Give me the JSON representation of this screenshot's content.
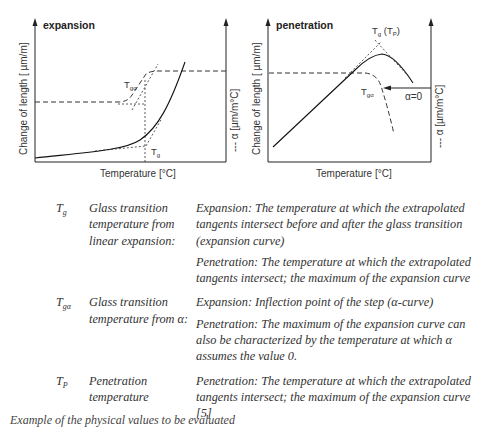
{
  "diagrams": [
    {
      "title": "expansion",
      "y_left_label": "Change of length [ µm/m]",
      "y_right_label": "--- α [µm/m°C]",
      "x_label": "Temperature [°C]",
      "annotations": {
        "tga": "T",
        "tga_sub": "gα",
        "tg": "T",
        "tg_sub": "g"
      }
    },
    {
      "title": "penetration",
      "y_left_label": "Change of length [ µm/m]",
      "y_right_label": "--- α [µm/m°C]",
      "x_label": "Temperature [°C]",
      "annotations": {
        "tg": "T",
        "tg_sub": "g",
        "tp_open": " (T",
        "tp_sub": "P",
        "tp_close": ")",
        "tga": "T",
        "tga_sub": "gα",
        "alpha0": "α=0"
      }
    }
  ],
  "table": [
    {
      "symbol": "T",
      "symbol_sub": "g",
      "name": "Glass transition temperature from linear expansion:",
      "descriptions": [
        "Expansion: The temperature at which the extrapolated tangents intersect before and after the glass transition (expansion curve)",
        "Penetration: The temperature at which the extrapolated tangents intersect; the maximum of the expansion curve"
      ]
    },
    {
      "symbol": "T",
      "symbol_sub": "gα",
      "name": "Glass transition temperature from α:",
      "descriptions": [
        "Expansion: Inflection point of the step (α-curve)",
        "Penetration: The maximum of the expansion curve can also be characterized by the temperature at which α assumes the value 0."
      ]
    },
    {
      "symbol": "T",
      "symbol_sub": "P",
      "name": "Penetration temperature",
      "descriptions": [
        "Penetration: The temperature at which the extrapolated tangents intersect; the maximum of the expansion curve [5]"
      ]
    }
  ],
  "caption": "Example of the physical values to be evaluated"
}
